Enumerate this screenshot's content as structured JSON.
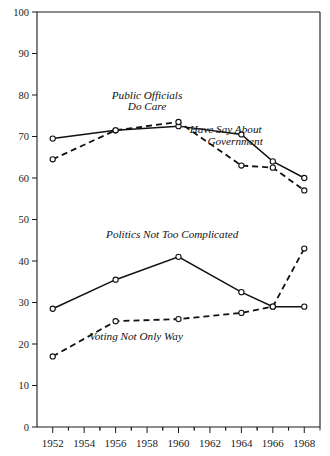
{
  "chart_data": {
    "type": "line",
    "title": "",
    "subtitle": "",
    "xlabel": "",
    "ylabel": "",
    "xlim": [
      1951,
      1969
    ],
    "ylim": [
      0,
      100
    ],
    "grid": false,
    "legend_position": "inline-annotations",
    "x": [
      1952,
      1956,
      1958,
      1960,
      1962,
      1964,
      1966,
      1968
    ],
    "xtick_labels": [
      "1952",
      "1954",
      "1956",
      "1958",
      "1960",
      "1962",
      "1964",
      "1966",
      "1968"
    ],
    "xtick_values": [
      1952,
      1954,
      1956,
      1958,
      1960,
      1962,
      1964,
      1966,
      1968
    ],
    "ytick_labels": [
      "0",
      "10",
      "20",
      "30",
      "40",
      "50",
      "60",
      "70",
      "80",
      "90",
      "100"
    ],
    "ytick_values": [
      0,
      10,
      20,
      30,
      40,
      50,
      60,
      70,
      80,
      90,
      100
    ],
    "series": [
      {
        "name": "Have Say About Government",
        "style": "solid",
        "label_lines": [
          "Have Say About",
          "Government"
        ],
        "x": [
          1952,
          1956,
          1960,
          1964,
          1966,
          1968
        ],
        "values": [
          69.5,
          71.5,
          72.5,
          70.5,
          64.0,
          60.0
        ]
      },
      {
        "name": "Public Officials Do Care",
        "style": "dashed",
        "label_lines": [
          "Public Officials",
          "Do Care"
        ],
        "x": [
          1952,
          1956,
          1960,
          1964,
          1966,
          1968
        ],
        "values": [
          64.5,
          71.5,
          73.5,
          63.0,
          62.5,
          57.0
        ]
      },
      {
        "name": "Politics Not Too Complicated",
        "style": "solid",
        "label_lines": [
          "Politics Not Too Complicated"
        ],
        "x": [
          1952,
          1956,
          1960,
          1964,
          1966,
          1968
        ],
        "values": [
          28.5,
          35.5,
          41.0,
          32.5,
          29.0,
          29.0
        ]
      },
      {
        "name": "Voting Not Only Way",
        "style": "dashed",
        "label_lines": [
          "Voting Not Only Way"
        ],
        "x": [
          1952,
          1956,
          1960,
          1964,
          1966,
          1968
        ],
        "values": [
          17.0,
          25.5,
          26.0,
          27.5,
          29.0,
          43.0
        ]
      }
    ],
    "annotations": [
      {
        "text": "Public Officials",
        "x": 1958.0,
        "y": 79.0
      },
      {
        "text": "Do Care",
        "x": 1958.0,
        "y": 76.3
      },
      {
        "text": "Have Say About",
        "x": 1963.0,
        "y": 70.8
      },
      {
        "text": "Government",
        "x": 1963.6,
        "y": 68.0
      },
      {
        "text": "Politics Not Too Complicated",
        "x": 1959.6,
        "y": 45.5
      },
      {
        "text": "Voting Not Only Way",
        "x": 1957.3,
        "y": 21.0
      }
    ]
  }
}
